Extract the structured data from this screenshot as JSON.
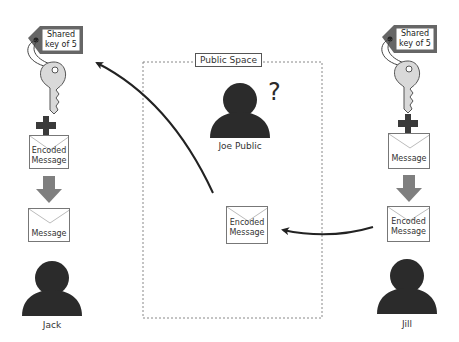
{
  "public_space": {
    "label": "Public Space",
    "observer": {
      "name": "Joe Public",
      "question_mark": "?"
    },
    "envelope": {
      "line1": "Encoded",
      "line2": "Message"
    }
  },
  "jack": {
    "name": "Jack",
    "key_tag": {
      "line1": "Shared",
      "line2": "key of 5"
    },
    "envelope_top": {
      "line1": "Encoded",
      "line2": "Message"
    },
    "envelope_bottom": {
      "line1": "Message"
    }
  },
  "jill": {
    "name": "Jill",
    "key_tag": {
      "line1": "Shared",
      "line2": "key of 5"
    },
    "envelope_top": {
      "line1": "Message"
    },
    "envelope_bottom": {
      "line1": "Encoded",
      "line2": "Message"
    }
  },
  "colors": {
    "person": "#2b2b2b",
    "key_fill": "#d9d9d9",
    "tag_border": "#666666",
    "plus": "#3a3a3a",
    "down_arrow": "#7f7f7f",
    "flow_arrow": "#222222",
    "dotted_border": "#888888"
  }
}
